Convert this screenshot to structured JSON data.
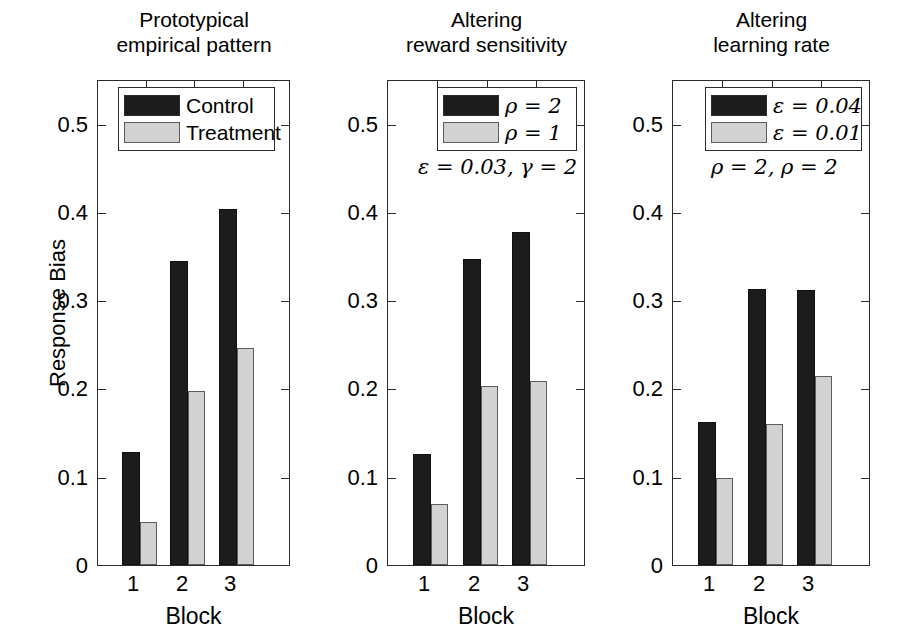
{
  "figure": {
    "ylabel": "Response Bias",
    "xlabel": "Block",
    "y_ticklabels": [
      "0",
      "0.1",
      "0.2",
      "0.3",
      "0.4",
      "0.5"
    ],
    "y_tickvalues": [
      0,
      0.1,
      0.2,
      0.3,
      0.4,
      0.5
    ],
    "x_ticklabels": [
      "1",
      "2",
      "3"
    ],
    "colors": {
      "dark_series": "#1c1c1c",
      "light_series": "#d2d2d2",
      "axis": "#2b2b2b",
      "background": "#ffffff"
    }
  },
  "chart_data": [
    {
      "type": "bar",
      "title": "Prototypical empirical pattern",
      "title_lines": [
        "Prototypical",
        "empirical pattern"
      ],
      "categories": [
        "1",
        "2",
        "3"
      ],
      "xlabel": "Block",
      "ylabel": "Response Bias",
      "ylim": [
        0,
        0.56
      ],
      "yticks": [
        0,
        0.1,
        0.2,
        0.3,
        0.4,
        0.5
      ],
      "grid": false,
      "legend_position": "upper center",
      "series": [
        {
          "name": "Control",
          "color": "#1c1c1c",
          "values": [
            0.13,
            0.35,
            0.41
          ]
        },
        {
          "name": "Treatment",
          "color": "#d2d2d2",
          "values": [
            0.05,
            0.2,
            0.25
          ]
        }
      ],
      "annotation": ""
    },
    {
      "type": "bar",
      "title": "Altering reward sensitivity",
      "title_lines": [
        "Altering",
        "reward sensitivity"
      ],
      "categories": [
        "1",
        "2",
        "3"
      ],
      "xlabel": "Block",
      "ylabel": "",
      "ylim": [
        0,
        0.56
      ],
      "yticks": [
        0,
        0.1,
        0.2,
        0.3,
        0.4,
        0.5
      ],
      "grid": false,
      "legend_position": "upper right",
      "series": [
        {
          "name": "ρ = 2",
          "color": "#1c1c1c",
          "values": [
            0.128,
            0.353,
            0.384
          ]
        },
        {
          "name": "ρ = 1",
          "color": "#d2d2d2",
          "values": [
            0.07,
            0.206,
            0.212
          ]
        }
      ],
      "annotation": "ε = 0.03, γ = 2"
    },
    {
      "type": "bar",
      "title": "Altering learning rate",
      "title_lines": [
        "Altering",
        "learning rate"
      ],
      "categories": [
        "1",
        "2",
        "3"
      ],
      "xlabel": "Block",
      "ylabel": "",
      "ylim": [
        0,
        0.56
      ],
      "yticks": [
        0,
        0.1,
        0.2,
        0.3,
        0.4,
        0.5
      ],
      "grid": false,
      "legend_position": "upper right",
      "series": [
        {
          "name": "ε = 0.04",
          "color": "#1c1c1c",
          "values": [
            0.165,
            0.318,
            0.317
          ]
        },
        {
          "name": "ε = 0.01",
          "color": "#d2d2d2",
          "values": [
            0.1,
            0.162,
            0.218
          ]
        }
      ],
      "annotation": "ρ = 2, ρ = 2"
    }
  ]
}
